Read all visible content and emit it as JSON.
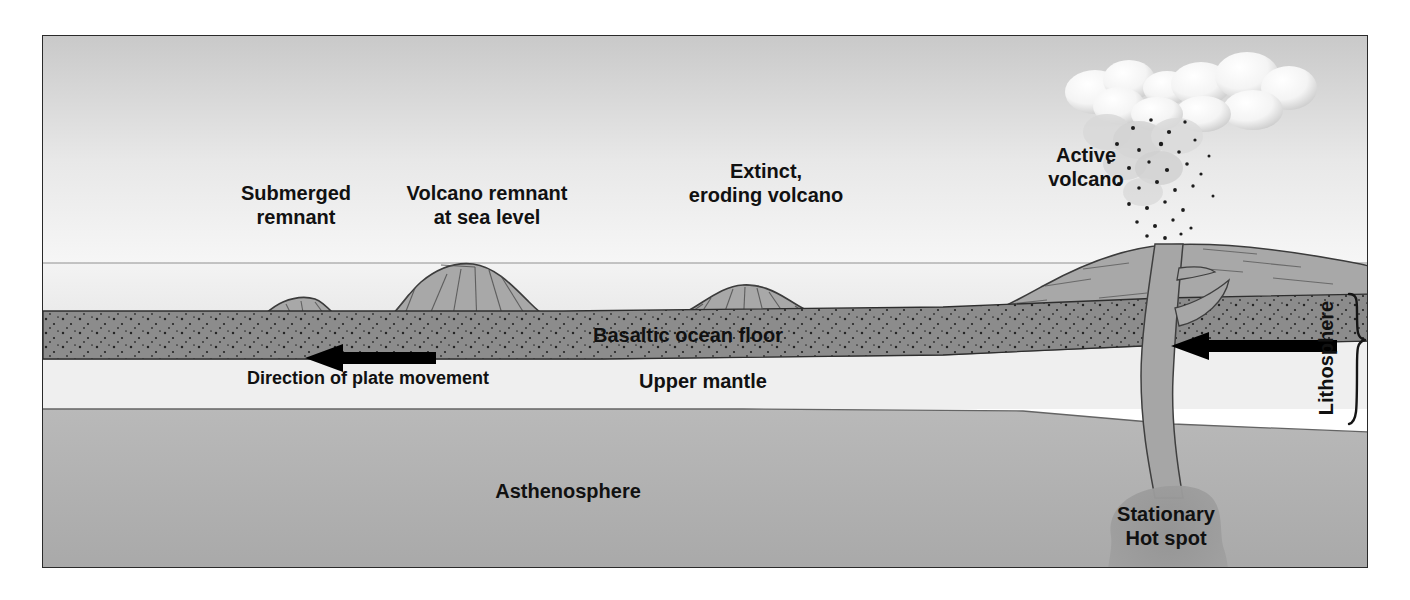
{
  "figure": {
    "frame_border_color": "#2a2a2a",
    "background_color": "#ffffff"
  },
  "labels": {
    "submerged_remnant_line1": "Submerged",
    "submerged_remnant_line2": "remnant",
    "volcano_remnant_line1": "Volcano remnant",
    "volcano_remnant_line2": "at sea level",
    "extinct_volcano_line1": "Extinct,",
    "extinct_volcano_line2": "eroding volcano",
    "active_volcano_line1": "Active",
    "active_volcano_line2": "volcano",
    "basaltic_ocean_floor": "Basaltic ocean floor",
    "direction_of_plate_movement": "Direction of plate movement",
    "upper_mantle": "Upper mantle",
    "asthenosphere": "Asthenosphere",
    "lithosphere": "Lithosphere",
    "hot_spot_line1": "Stationary",
    "hot_spot_line2": "Hot spot"
  },
  "colors": {
    "sky_top": "#c9c9c9",
    "sky_bottom": "#f4f4f4",
    "water_top": "#f2f2f2",
    "water_bottom": "#e3e3e3",
    "volcano_fill": "#a8a8a8",
    "volcano_stroke": "#3a3a3a",
    "crust_fill": "#8c8c8c",
    "crust_stroke": "#2e2e2e",
    "upper_mantle_fill": "#efefef",
    "asthenosphere_fill": "#b4b4b4",
    "hotspot_fill": "#9a9a9a",
    "conduit_fill": "#a0a0a0",
    "cloud_fill": "#fdfdfd",
    "cloud_shade": "#cfcfcf",
    "arrow_fill": "#000000",
    "text": "#111111"
  },
  "geometry": {
    "sea_level_y": 227,
    "crust_top_y": 275,
    "crust_bottom_y": 323,
    "mantle_bottom_y": 373,
    "figure_width": 1326,
    "figure_height": 533
  },
  "features": [
    {
      "name": "submerged-remnant",
      "type": "seamount",
      "center_x": 250,
      "label_x": 255,
      "label_y": 160
    },
    {
      "name": "volcano-remnant-at-sea-level",
      "type": "shield-volcano",
      "center_x": 420,
      "label_x": 445,
      "label_y": 160
    },
    {
      "name": "extinct-eroding-volcano",
      "type": "eroded-volcano",
      "center_x": 710,
      "label_x": 725,
      "label_y": 160
    },
    {
      "name": "active-volcano",
      "type": "erupting-volcano",
      "center_x": 1120,
      "label_x": 1043,
      "label_y": 120
    }
  ],
  "arrows": [
    {
      "name": "plate-movement-arrow-left",
      "x_start": 435,
      "x_end": 290,
      "y": 322,
      "direction": "left"
    },
    {
      "name": "plate-movement-arrow-right",
      "x_start": 1300,
      "x_end": 1160,
      "y": 310,
      "direction": "left"
    }
  ]
}
